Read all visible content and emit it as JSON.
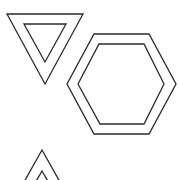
{
  "canvas": {
    "width": 179,
    "height": 180,
    "background": "#ffffff"
  },
  "stroke": {
    "color": "#2a2a2a",
    "width": 1.3
  },
  "shapes": [
    {
      "name": "inverted-triangle-outer",
      "type": "polygon",
      "points": "7,14 83,14 45,84"
    },
    {
      "name": "inverted-triangle-inner",
      "type": "polygon",
      "points": "24,24 66,24 45,62"
    },
    {
      "name": "hexagon-outer",
      "type": "polygon",
      "points": "94,34 149,34 176,84 149,134 94,134 67,84"
    },
    {
      "name": "hexagon-inner",
      "type": "polygon",
      "points": "99,44 144,44 164,84 144,124 100,124 78,84"
    },
    {
      "name": "upright-triangle-outer",
      "type": "polyline",
      "points": "24,182 42,150 60,182"
    },
    {
      "name": "upright-triangle-inner",
      "type": "polyline",
      "points": "35,183 42,171 49,183"
    }
  ]
}
